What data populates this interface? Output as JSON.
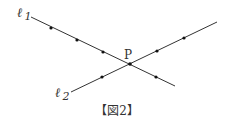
{
  "figure": {
    "caption": "【図2】",
    "point_label": "P",
    "lines": [
      {
        "name": "ℓ1",
        "label_main": "ℓ",
        "label_sub": "1",
        "start": [
          31,
          17
        ],
        "end": [
          175,
          86
        ],
        "dots": [
          [
            51,
            28
          ],
          [
            77,
            40
          ],
          [
            103,
            52
          ],
          [
            156,
            77
          ]
        ]
      },
      {
        "name": "ℓ2",
        "label_main": "ℓ",
        "label_sub": "2",
        "start": [
          71,
          92
        ],
        "end": [
          217,
          22
        ],
        "dots": [
          [
            102,
            77
          ],
          [
            157,
            51
          ],
          [
            184,
            38
          ]
        ]
      }
    ],
    "intersection": [
      130,
      64
    ],
    "line_color": "#333333"
  }
}
